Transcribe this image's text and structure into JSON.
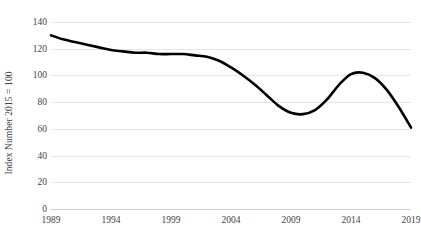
{
  "chart_data": {
    "type": "line",
    "title": "",
    "subtitle": "",
    "xlabel": "",
    "ylabel": "Index Number 2015 = 100",
    "xlim": [
      1989,
      2019
    ],
    "ylim": [
      0,
      140
    ],
    "grid": true,
    "grid_axis": "y",
    "legend": false,
    "legend_position": "none",
    "line_color": "#000000",
    "line_width_px": 2.6,
    "gridline_color": "#e6e6e6",
    "text_color": "#3f3f3f",
    "background_color": "#ffffff",
    "y_ticks": [
      0,
      20,
      40,
      60,
      80,
      100,
      120,
      140
    ],
    "y_tick_labels": [
      "0",
      "20",
      "40",
      "60",
      "80",
      "100",
      "120",
      "140"
    ],
    "x_ticks": [
      1989,
      1994,
      1999,
      2004,
      2009,
      2014,
      2019
    ],
    "x_tick_labels": [
      "1989",
      "1994",
      "1999",
      "2004",
      "2009",
      "2014",
      "2019"
    ],
    "series": [
      {
        "name": "Index",
        "x": [
          1989,
          1990,
          1991,
          1992,
          1993,
          1994,
          1995,
          1996,
          1997,
          1998,
          1999,
          2000,
          2001,
          2002,
          2003,
          2004,
          2005,
          2006,
          2007,
          2008,
          2009,
          2010,
          2011,
          2012,
          2013,
          2014,
          2015,
          2016,
          2017,
          2018,
          2019
        ],
        "values": [
          130,
          127,
          125,
          123,
          121,
          119,
          118,
          117,
          117,
          116,
          116,
          116,
          115,
          114,
          111,
          106,
          100,
          93,
          85,
          77,
          72,
          71,
          74,
          82,
          93,
          101,
          102,
          98,
          89,
          76,
          61
        ]
      }
    ],
    "annotations": []
  }
}
